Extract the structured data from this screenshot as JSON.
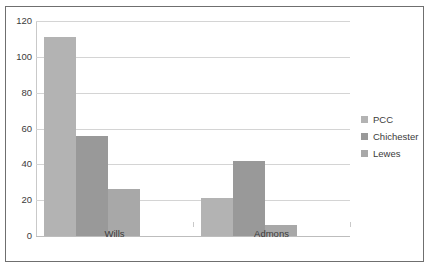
{
  "chart_data": {
    "type": "bar",
    "title": "",
    "subtitle": "",
    "xlabel": "",
    "ylabel": "",
    "categories": [
      "Wills",
      "Admons"
    ],
    "series": [
      {
        "name": "PCC",
        "values": [
          111,
          21
        ],
        "color": "#b3b3b3"
      },
      {
        "name": "Chichester",
        "values": [
          56,
          42
        ],
        "color": "#999999"
      },
      {
        "name": "Lewes",
        "values": [
          26,
          6
        ],
        "color": "#a8a8a8"
      }
    ],
    "ylim": [
      0,
      120
    ],
    "yticks": [
      0,
      20,
      40,
      60,
      80,
      100,
      120
    ],
    "ytick_labels": [
      "0",
      "20",
      "40",
      "60",
      "80",
      "100",
      "120"
    ],
    "grid": true,
    "grid_axis": "y",
    "legend_position": "right",
    "plot_background": "#ffffff",
    "grid_color": "#d4d4d4",
    "axis_color": "#c9c9c9",
    "border_color": "#6f6f6f",
    "text_color": "#3b3b3b"
  }
}
